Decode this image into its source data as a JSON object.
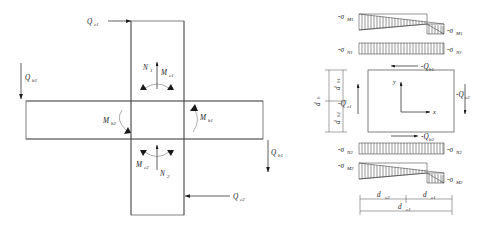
{
  "diagram": {
    "left_panel": {
      "name": "joint-force-diagram",
      "description": "Cross-shaped beam-column joint with applied shears, axial forces and moments",
      "labels": {
        "q_top": "Q",
        "q_top_sub": "c1",
        "q_left": "Q",
        "q_left_sub": "b2",
        "q_right": "Q",
        "q_right_sub": "b1",
        "q_bottom": "Q",
        "q_bottom_sub": "c2",
        "n_top": "N",
        "n_top_sub": "1",
        "m_top": "M",
        "m_top_sub": "c1",
        "n_bottom": "N",
        "n_bottom_sub": "2",
        "m_bottom": "M",
        "m_bottom_sub": "c2",
        "m_beam_left": "M",
        "m_beam_left_sub": "b2",
        "m_beam_right": "M",
        "m_beam_right_sub": "b1"
      }
    },
    "right_panel": {
      "name": "stress-distribution-diagram",
      "description": "Column panel zone with bending and axial stress blocks above and below",
      "stress_blocks": [
        {
          "id": "moment-top",
          "type": "bending",
          "left_label": "-σ",
          "left_sub": "M1",
          "right_label": "-σ",
          "right_sub": "M1",
          "shape": "bowtie"
        },
        {
          "id": "axial-top",
          "type": "axial",
          "left_label": "-σ",
          "left_sub": "N1",
          "right_label": "-σ",
          "right_sub": "N1",
          "shape": "uniform"
        },
        {
          "id": "axial-bottom",
          "type": "axial",
          "left_label": "-σ",
          "left_sub": "N2",
          "right_label": "-σ",
          "right_sub": "N2",
          "shape": "uniform"
        },
        {
          "id": "moment-bottom",
          "type": "bending",
          "left_label": "-σ",
          "left_sub": "M2",
          "right_label": "-σ",
          "right_sub": "M2",
          "shape": "bowtie"
        }
      ],
      "shear_labels": {
        "top": "-Q",
        "top_sub": "b1",
        "bottom": "-Q",
        "bottom_sub": "b2",
        "left": "-Q",
        "left_sub": "c1",
        "right": "-Q",
        "right_sub": "c2"
      },
      "axes": {
        "x": "x",
        "y": "y"
      },
      "dimensions": {
        "vertical_total": "d",
        "vertical_total_sub": "b",
        "vertical_upper": "d",
        "vertical_upper_sub": "b1",
        "vertical_lower": "d",
        "vertical_lower_sub": "b2",
        "horizontal_left": "d",
        "horizontal_left_sub": "c2",
        "horizontal_right": "d",
        "horizontal_right_sub": "c1",
        "horizontal_total": "d",
        "horizontal_total_sub": "c1"
      }
    },
    "colors": {
      "line": "#4a4a4a",
      "ink": "#1a1a1a",
      "background": "#ffffff"
    }
  }
}
